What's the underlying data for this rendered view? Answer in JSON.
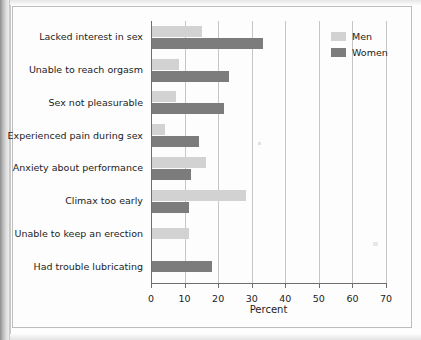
{
  "chart_data": {
    "type": "bar",
    "orientation": "horizontal",
    "title": "",
    "xlabel": "Percent",
    "ylabel": "",
    "xlim": [
      0,
      70
    ],
    "xticks": [
      0,
      10,
      20,
      30,
      40,
      50,
      60,
      70
    ],
    "xtick_labels": [
      "0",
      "10",
      "20",
      "30",
      "40",
      "50",
      "60",
      "70"
    ],
    "grid": "vertical",
    "legend_position": "top-right",
    "categories": [
      "Lacked interest in sex",
      "Unable to reach orgasm",
      "Sex not pleasurable",
      "Experienced pain during sex",
      "Anxiety about performance",
      "Climax too early",
      "Unable to keep an erection",
      "Had trouble lubricating"
    ],
    "series": [
      {
        "name": "Men",
        "color": "#d2d2d2",
        "values": [
          15,
          8,
          7,
          4,
          16,
          28,
          11,
          null
        ]
      },
      {
        "name": "Women",
        "color": "#7c7c7c",
        "values": [
          33,
          23,
          21.5,
          14,
          11.5,
          11,
          null,
          18
        ]
      }
    ]
  },
  "legend": {
    "items": [
      {
        "label": "Men",
        "swatch": "men"
      },
      {
        "label": "Women",
        "swatch": "women"
      }
    ]
  },
  "axis": {
    "x_title": "Percent"
  }
}
